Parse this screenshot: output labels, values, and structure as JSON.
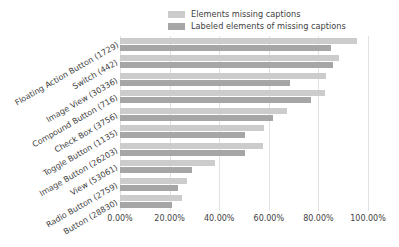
{
  "chart_data": {
    "type": "bar",
    "orientation": "horizontal",
    "title": "",
    "xlabel": "",
    "ylabel": "",
    "xlim": [
      0,
      100
    ],
    "grid": true,
    "legend_position": "top",
    "xtick_labels": [
      "0.00%",
      "20.00%",
      "40.00%",
      "60.00%",
      "80.00%",
      "100.00%"
    ],
    "xtick_values": [
      0,
      20,
      40,
      60,
      80,
      100
    ],
    "categories": [
      "Floating Action Button (1729)",
      "Switch (442)",
      "Image View (30336)",
      "Compound Button (716)",
      "Check Box (3756)",
      "Toggle Button (1135)",
      "Image Button (26203)",
      "View (53061)",
      "Radio Button (2759)",
      "Button (28830)"
    ],
    "series": [
      {
        "name": "Elements missing captions",
        "color": "#cccccc",
        "values": [
          95.5,
          88.5,
          83.0,
          82.5,
          67.5,
          58.0,
          57.5,
          38.5,
          27.0,
          25.0
        ]
      },
      {
        "name": "Labeled elements of missing captions",
        "color": "#a6a6a6",
        "values": [
          85.0,
          86.0,
          68.5,
          77.0,
          61.5,
          50.5,
          50.5,
          29.0,
          23.5,
          21.0
        ]
      }
    ]
  },
  "legend": {
    "items": [
      {
        "label": "Elements missing captions",
        "color": "#cccccc"
      },
      {
        "label": "Labeled elements of missing captions",
        "color": "#a6a6a6"
      }
    ]
  }
}
